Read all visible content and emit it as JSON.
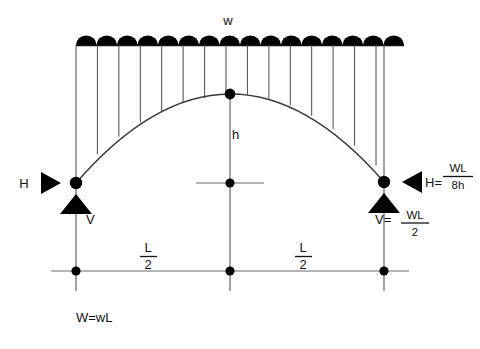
{
  "diagram": {
    "labels": {
      "load_intensity": "w",
      "rise": "h",
      "horizontal_reaction_left": "H",
      "vertical_reaction_left": "V",
      "horizontal_reaction_right_lhs": "H=",
      "vertical_reaction_right_lhs": "V=",
      "total_load": "W=wL",
      "span_half_left_numerator": "L",
      "span_half_left_denominator": "2",
      "span_half_right_numerator": "L",
      "span_half_right_denominator": "2"
    },
    "formulas": {
      "horizontal_reaction": {
        "lhs": "H=",
        "numerator": "WL",
        "denominator": "8h"
      },
      "vertical_reaction": {
        "lhs": "V=",
        "numerator": "WL",
        "denominator": "2"
      },
      "total_load": "W=wL"
    },
    "geometry": {
      "left_support_x": 76,
      "right_support_x": 384,
      "crown_x": 230,
      "crown_y": 94,
      "springing_y": 183,
      "load_line_y": 45,
      "baseline_y": 271,
      "load_bump_count": 16
    },
    "colors": {
      "ink": "#000000",
      "line": "#4a4a4a",
      "background": "#ffffff"
    }
  }
}
